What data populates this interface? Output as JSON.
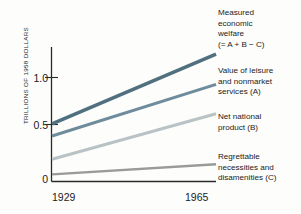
{
  "chart_data": {
    "type": "line",
    "title": "",
    "xlabel": "",
    "ylabel": "TRILLIONS OF 1958 DOLLARS",
    "x": [
      1929,
      1965
    ],
    "categories": [
      "1929",
      "1965"
    ],
    "xticklabels": [
      "1929",
      "1965"
    ],
    "yticklabels": [
      "0",
      "0.5",
      "1.0"
    ],
    "yticks": [
      0,
      0.5,
      1.0
    ],
    "ylim": [
      0,
      1.33
    ],
    "xlim": [
      1929,
      1965
    ],
    "grid": false,
    "legend_position": "right-inline-labels",
    "series": [
      {
        "name": "Measured economic welfare (= A + B − C)",
        "values": [
          0.57,
          1.26
        ],
        "color": "#51707f"
      },
      {
        "name": "Value of leisure and nonmarket services (A)",
        "values": [
          0.45,
          0.96
        ],
        "color": "#6f8c9c"
      },
      {
        "name": "Net national product (B)",
        "values": [
          0.22,
          0.67
        ],
        "color": "#b9c3c6"
      },
      {
        "name": "Regrettable necessities and disamenities (C)",
        "values": [
          0.07,
          0.17
        ],
        "color": "#9a9a9a"
      }
    ]
  },
  "axis": {
    "y_title": "TRILLIONS OF 1958 DOLLARS",
    "y_ticks": [
      {
        "label": "1.0"
      },
      {
        "label": "0.5"
      },
      {
        "label": "0"
      }
    ],
    "x_ticks": [
      {
        "label": "1929"
      },
      {
        "label": "1965"
      }
    ]
  },
  "legend": {
    "items": [
      {
        "name": "measured-economic-welfare",
        "lines": [
          "Measured",
          "economic",
          "welfare",
          "(= A + B − C)"
        ],
        "color": "#51707f"
      },
      {
        "name": "value-of-leisure",
        "lines": [
          "Value of leisure",
          "and nonmarket",
          "services (A)"
        ],
        "color": "#6f8c9c"
      },
      {
        "name": "net-national-product",
        "lines": [
          "Net national",
          "product (B)"
        ],
        "color": "#b9c3c6"
      },
      {
        "name": "regrettable-necessities",
        "lines": [
          "Regrettable",
          "necessities and",
          "disamenities (C)"
        ],
        "color": "#9a9a9a"
      }
    ]
  }
}
